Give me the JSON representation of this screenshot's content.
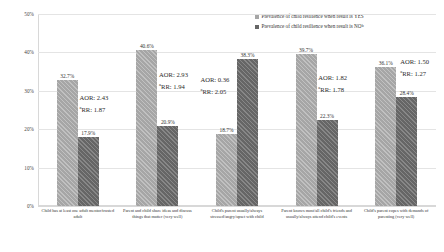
{
  "chart_data": {
    "type": "bar",
    "title": "",
    "xlabel": "",
    "ylabel": "",
    "ylim": [
      0,
      50
    ],
    "grid": true,
    "legend_position": "top-right",
    "ytick_labels": [
      "50%",
      "40%",
      "30%",
      "20%",
      "10%",
      "0%"
    ],
    "ytick_values": [
      50,
      40,
      30,
      20,
      10,
      0
    ],
    "categories": [
      "Child has at least one adult mentor/trusted adult",
      "Parent and child  share ideas and discuss things that matter (very well)",
      "Child's parent usually/always stressed/angry/upset with child",
      "Parent knows most/all child's friends and  usually/always attend child's events",
      "Child's parent copes with demands of parenting (very well)"
    ],
    "series": [
      {
        "name": "Prevalence of child resilience when result is YES",
        "key": "yes",
        "color": "#a6a6a6",
        "values": [
          32.7,
          40.6,
          18.7,
          39.7,
          36.1
        ],
        "labels": [
          "32.7%",
          "40.6%",
          "18.7%",
          "39.7%",
          "36.1%"
        ]
      },
      {
        "name": "Prevalence of child resilience when result is NO",
        "key": "no",
        "color": "#666666",
        "values": [
          17.9,
          20.9,
          38.3,
          22.3,
          28.4
        ],
        "labels": [
          "17.9%",
          "20.9%",
          "38.3%",
          "22.3%",
          "28.4%"
        ]
      }
    ],
    "annotations": [
      {
        "aor": "AOR: 2.43",
        "rr_sup": "a",
        "rr": "RR: 1.87"
      },
      {
        "aor": "AOR: 2.93",
        "rr_sup": "a",
        "rr": "RR: 1.94"
      },
      {
        "aor": "AOR: 0.36",
        "rr_sup": "a",
        "rr": "RR: 2.05"
      },
      {
        "aor": "AOR: 1.82",
        "rr_sup": "a",
        "rr": "RR: 1.78"
      },
      {
        "aor": "AOR: 1.50",
        "rr_sup": "a",
        "rr": "RR: 1.27"
      }
    ]
  },
  "legend": {
    "items": [
      {
        "label": "Prevalence of child resilience when result is YES",
        "sup": ""
      },
      {
        "label": "Prevalence of child resilience when result is NO",
        "sup": "b"
      }
    ]
  }
}
